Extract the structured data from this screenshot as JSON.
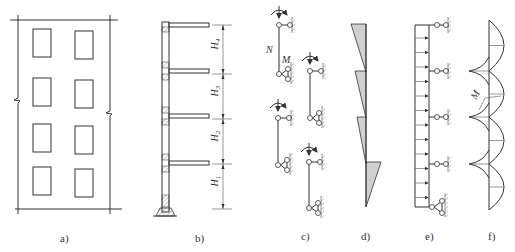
{
  "figure": {
    "panels": [
      {
        "id": "a",
        "label": "a)",
        "description": "building elevation with 4 stories x 2 window columns"
      },
      {
        "id": "b",
        "label": "b)",
        "description": "wall section with 4 floor slabs"
      },
      {
        "id": "c",
        "label": "c)",
        "description": "story-by-story hinged member models"
      },
      {
        "id": "d",
        "label": "d)",
        "description": "axial force diagram per story"
      },
      {
        "id": "e",
        "label": "e)",
        "description": "continuous beam under uniform lateral load"
      },
      {
        "id": "f",
        "label": "f)",
        "description": "bending moment diagram"
      }
    ],
    "panel_b": {
      "dimension_labels": [
        {
          "main": "H",
          "sub": "4"
        },
        {
          "main": "H",
          "sub": "3"
        },
        {
          "main": "H",
          "sub": "2"
        },
        {
          "main": "H",
          "sub": "1"
        }
      ]
    },
    "panel_c": {
      "force_label": "N",
      "moment_label": "M"
    },
    "panel_f": {
      "moment_label": "M"
    },
    "window_grid": {
      "rows": 4,
      "cols": 2
    },
    "stories": 4
  }
}
